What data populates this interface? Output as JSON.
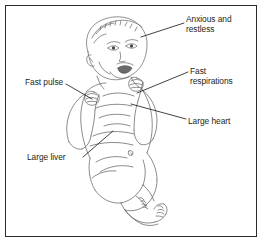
{
  "figure": {
    "background_color": "#ffffff",
    "frame_color": "#2b2b2b",
    "ink_color": "#4a4a4a",
    "text_color": "#231f20"
  },
  "annotations": {
    "anxious_restless": {
      "text": "Anxious and\nrestless",
      "line1": "Anxious and",
      "line2": "restless",
      "side": "right",
      "points_to": "head"
    },
    "fast_respirations": {
      "text": "Fast\nrespirations",
      "line1": "Fast",
      "line2": "respirations",
      "side": "right",
      "points_to": "chest"
    },
    "large_heart": {
      "text": "Large heart",
      "side": "right",
      "points_to": "heart"
    },
    "fast_pulse": {
      "text": "Fast pulse",
      "side": "left",
      "points_to": "wrist"
    },
    "large_liver": {
      "text": "Large liver",
      "side": "left",
      "points_to": "abdomen"
    }
  }
}
